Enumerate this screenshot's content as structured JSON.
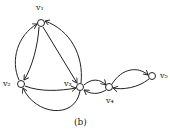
{
  "diagram": {
    "caption": "(b)",
    "nodes": [
      {
        "id": "v1",
        "label": "v₁",
        "x": 41,
        "y": 23
      },
      {
        "id": "v2",
        "label": "v₂",
        "x": 21,
        "y": 84
      },
      {
        "id": "v3",
        "label": "v₃",
        "x": 80,
        "y": 87
      },
      {
        "id": "v4",
        "label": "v₄",
        "x": 109,
        "y": 87
      },
      {
        "id": "v5",
        "label": "v₅",
        "x": 152,
        "y": 76
      }
    ],
    "edges": [
      {
        "from": "v2",
        "to": "v1",
        "style": "curve-left"
      },
      {
        "from": "v1",
        "to": "v2",
        "style": "curve-inner"
      },
      {
        "from": "v1",
        "to": "v3",
        "style": "straight"
      },
      {
        "from": "v3",
        "to": "v1",
        "style": "curve-outer"
      },
      {
        "from": "v2",
        "to": "v3",
        "style": "curve-upper"
      },
      {
        "from": "v3",
        "to": "v2",
        "style": "curve-lower"
      },
      {
        "from": "v3",
        "to": "v4",
        "style": "curve-upper"
      },
      {
        "from": "v4",
        "to": "v3",
        "style": "curve-lower"
      },
      {
        "from": "v4",
        "to": "v5",
        "style": "curve-upper"
      },
      {
        "from": "v5",
        "to": "v4",
        "style": "curve-lower"
      }
    ]
  }
}
